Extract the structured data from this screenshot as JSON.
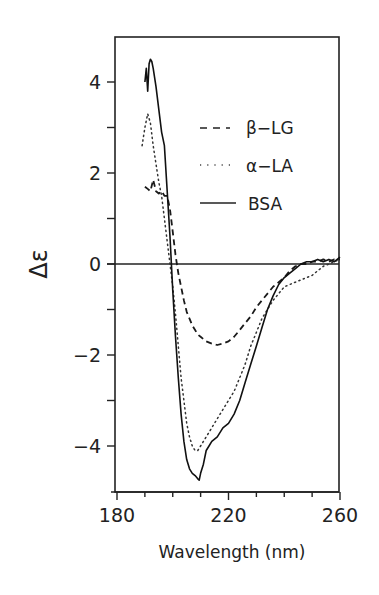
{
  "chart_data": {
    "type": "line",
    "title": "",
    "xlabel": "Wavelength (nm)",
    "ylabel": "Δε",
    "xlim": [
      180,
      260
    ],
    "ylim": [
      -5,
      5
    ],
    "xticks": [
      180,
      220,
      260
    ],
    "xminor_step": 10,
    "yticks": [
      4,
      2,
      0,
      -2,
      -4
    ],
    "yminor": [
      3,
      1,
      -1,
      -3
    ],
    "grid": false,
    "zero_line": true,
    "legend_position": "upper right (inside)",
    "series": [
      {
        "name": "β-LG",
        "style": "dashed",
        "x": [
          190,
          191,
          192,
          193,
          194,
          195,
          196,
          197,
          198,
          199,
          200,
          201,
          202,
          203,
          204,
          205,
          206,
          207,
          208,
          209,
          210,
          212,
          214,
          216,
          218,
          220,
          222,
          224,
          226,
          228,
          230,
          232,
          234,
          236,
          238,
          240,
          242,
          244,
          246,
          248,
          250,
          252,
          254,
          256,
          258,
          260
        ],
        "y": [
          1.7,
          1.65,
          1.6,
          1.85,
          1.6,
          1.55,
          1.6,
          1.5,
          1.5,
          1.2,
          0.7,
          0.2,
          -0.2,
          -0.5,
          -0.8,
          -1.05,
          -1.2,
          -1.35,
          -1.45,
          -1.55,
          -1.6,
          -1.7,
          -1.75,
          -1.78,
          -1.75,
          -1.7,
          -1.6,
          -1.45,
          -1.3,
          -1.15,
          -0.95,
          -0.8,
          -0.65,
          -0.5,
          -0.4,
          -0.3,
          -0.15,
          -0.05,
          0.0,
          0.0,
          0.05,
          0.05,
          0.1,
          0.05,
          0.1,
          0.1
        ]
      },
      {
        "name": "α-LA",
        "style": "dotted",
        "x": [
          189,
          190,
          191,
          192,
          193,
          194,
          195,
          196,
          197,
          198,
          199,
          200,
          201,
          202,
          203,
          204,
          205,
          206,
          207,
          208,
          209,
          210,
          212,
          214,
          216,
          218,
          220,
          222,
          224,
          226,
          228,
          230,
          232,
          234,
          236,
          238,
          240,
          242,
          244,
          246,
          248,
          250,
          252,
          254,
          256,
          258,
          260
        ],
        "y": [
          2.6,
          3.0,
          3.3,
          3.1,
          2.6,
          2.2,
          1.8,
          1.5,
          1.0,
          0.5,
          0.0,
          -0.5,
          -1.1,
          -1.8,
          -2.5,
          -3.0,
          -3.5,
          -3.8,
          -4.0,
          -4.1,
          -4.1,
          -4.0,
          -3.8,
          -3.6,
          -3.4,
          -3.2,
          -3.0,
          -2.8,
          -2.5,
          -2.2,
          -1.8,
          -1.5,
          -1.2,
          -1.0,
          -0.8,
          -0.65,
          -0.5,
          -0.45,
          -0.4,
          -0.35,
          -0.3,
          -0.25,
          -0.15,
          -0.05,
          0.0,
          0.05,
          0.1
        ]
      },
      {
        "name": "BSA",
        "style": "solid",
        "x": [
          190,
          190.5,
          191,
          191.5,
          192,
          192.5,
          193,
          194,
          195,
          196,
          197,
          198,
          199,
          199.5,
          200,
          201,
          202,
          203,
          204,
          205,
          206,
          207,
          208,
          209,
          209.5,
          210,
          211,
          212,
          213,
          214,
          216,
          218,
          220,
          222,
          224,
          226,
          228,
          230,
          232,
          234,
          236,
          238,
          240,
          242,
          244,
          246,
          248,
          250,
          252,
          254,
          256,
          258,
          260
        ],
        "y": [
          4.0,
          4.3,
          3.8,
          4.4,
          4.5,
          4.45,
          4.3,
          3.9,
          3.4,
          2.9,
          2.6,
          1.6,
          0.6,
          0.0,
          -0.6,
          -1.6,
          -2.5,
          -3.3,
          -3.9,
          -4.3,
          -4.5,
          -4.6,
          -4.65,
          -4.72,
          -4.75,
          -4.6,
          -4.4,
          -4.1,
          -4.0,
          -3.9,
          -3.8,
          -3.6,
          -3.5,
          -3.3,
          -3.0,
          -2.6,
          -2.2,
          -1.8,
          -1.4,
          -1.0,
          -0.7,
          -0.45,
          -0.3,
          -0.2,
          -0.1,
          0.0,
          0.05,
          0.05,
          0.1,
          0.05,
          0.1,
          0.05,
          0.15
        ]
      }
    ]
  },
  "axes": {
    "xlabel": "Wavelength (nm)",
    "ylabel": "Δε",
    "xtick_labels": [
      "180",
      "220",
      "260"
    ],
    "ytick_labels": [
      "4",
      "2",
      "0",
      "−2",
      "−4"
    ]
  },
  "legend": {
    "items": [
      {
        "label": "β−LG",
        "style": "dashed"
      },
      {
        "label": "α−LA",
        "style": "dotted"
      },
      {
        "label": "BSA",
        "style": "solid"
      }
    ]
  },
  "colors": {
    "ink": "#1a1a1a",
    "background": "#ffffff"
  }
}
